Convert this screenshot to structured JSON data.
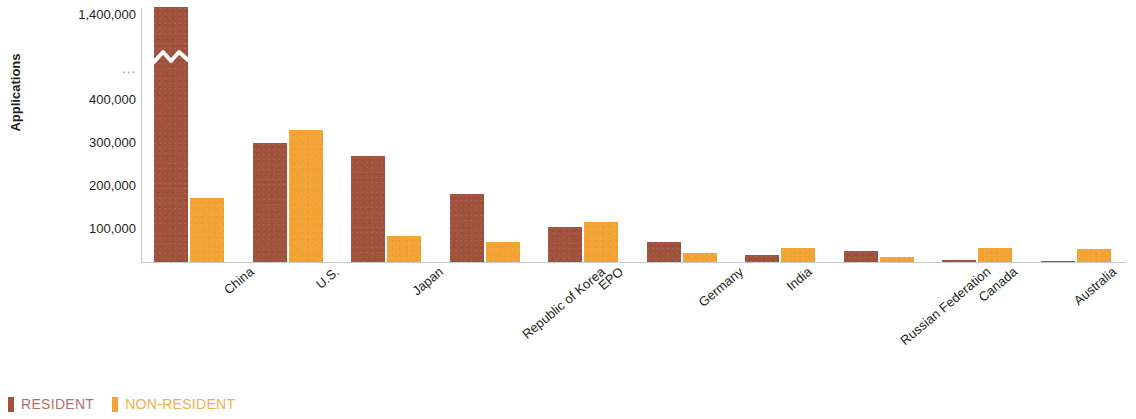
{
  "chart_data": {
    "type": "bar",
    "title": "",
    "subtitle": "",
    "xlabel": "",
    "ylabel": "Applications",
    "categories": [
      "China",
      "U.S.",
      "Japan",
      "Republic of Korea",
      "EPO",
      "Germany",
      "India",
      "Russian Federation",
      "Canada",
      "Australia"
    ],
    "series": [
      {
        "name": "RESIDENT",
        "color": "#a0523c",
        "values": [
          1400000,
          280000,
          250000,
          160000,
          82000,
          48000,
          17000,
          26000,
          4000,
          2500
        ]
      },
      {
        "name": "NON-RESIDENT",
        "color": "#f3a234",
        "values": [
          150000,
          310000,
          62000,
          48000,
          93000,
          22000,
          33000,
          12000,
          33000,
          30000
        ]
      }
    ],
    "ytick_labels": [
      "1,400,000",
      "...",
      "400,000",
      "300,000",
      "200,000",
      "100,000"
    ],
    "ytick_values": [
      1400000,
      null,
      400000,
      300000,
      200000,
      100000
    ],
    "ylim": [
      0,
      1400000
    ],
    "axis_break": {
      "present": true,
      "between": [
        400000,
        1400000
      ],
      "marker": "..."
    },
    "grid": false,
    "legend_position": "bottom-left"
  },
  "legend": {
    "items": [
      {
        "label": "RESIDENT",
        "color": "#a0523c"
      },
      {
        "label": "NON-RESIDENT",
        "color": "#f3a234"
      }
    ]
  },
  "y_axis": {
    "title": "Applications",
    "ticks": [
      {
        "label": "1,400,000",
        "top": 8
      },
      {
        "label": "...",
        "top": 62
      },
      {
        "label": "400,000",
        "top": 93
      },
      {
        "label": "300,000",
        "top": 136
      },
      {
        "label": "200,000",
        "top": 179
      },
      {
        "label": "100,000",
        "top": 222
      }
    ]
  },
  "x_axis": {
    "labels": [
      {
        "text": "China",
        "left": 72
      },
      {
        "text": "U.S.",
        "left": 166
      },
      {
        "text": "Japan",
        "left": 260
      },
      {
        "text": "Republic of Korea",
        "left": 354
      },
      {
        "text": "EPO",
        "left": 448
      },
      {
        "text": "Germany",
        "left": 542
      },
      {
        "text": "India",
        "left": 636
      },
      {
        "text": "Russian Federation",
        "left": 730
      },
      {
        "text": "Canada",
        "left": 824
      },
      {
        "text": "Australia",
        "left": 918
      }
    ]
  }
}
